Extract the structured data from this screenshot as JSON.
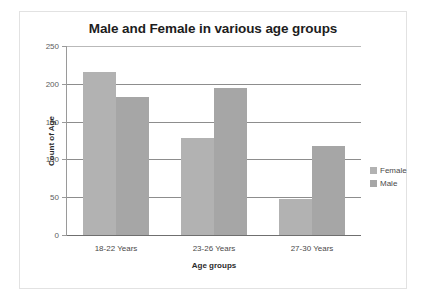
{
  "chart_data": {
    "type": "bar",
    "title": "Male and Female in various age groups",
    "xlabel": "Age groups",
    "ylabel": "Count of Age",
    "categories": [
      "18-22 Years",
      "23-26 Years",
      "27-30 Years"
    ],
    "series": [
      {
        "name": "Female",
        "values": [
          215,
          128,
          48
        ],
        "color": "#b2b2b2"
      },
      {
        "name": "Male",
        "values": [
          182,
          194,
          118
        ],
        "color": "#a6a6a6"
      }
    ],
    "ylim": [
      0,
      250
    ],
    "ytick_labels": [
      "250",
      "200",
      "150",
      "100",
      "50",
      "0"
    ],
    "ytick_values": [
      250,
      200,
      150,
      100,
      50,
      0
    ],
    "grid": true,
    "legend_position": "right"
  }
}
